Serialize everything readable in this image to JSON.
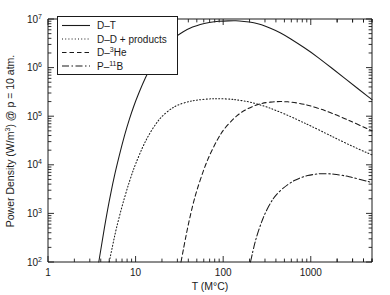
{
  "chart_data": {
    "type": "line",
    "title": "",
    "xlabel": "T (M°C)",
    "ylabel": "Power Density (W/m³) @ p = 10 atm.",
    "xscale": "log",
    "yscale": "log",
    "xlim": [
      1,
      5000
    ],
    "ylim": [
      100,
      10000000
    ],
    "grid": false,
    "legend_position": "upper-left",
    "xticks": [
      {
        "value": 1,
        "label": "1"
      },
      {
        "value": 10,
        "label": "10"
      },
      {
        "value": 100,
        "label": "100"
      },
      {
        "value": 1000,
        "label": "1000"
      }
    ],
    "yticks": [
      {
        "value": 100,
        "mantissa": "10",
        "exponent": "2"
      },
      {
        "value": 1000,
        "mantissa": "10",
        "exponent": "3"
      },
      {
        "value": 10000,
        "mantissa": "10",
        "exponent": "4"
      },
      {
        "value": 100000,
        "mantissa": "10",
        "exponent": "5"
      },
      {
        "value": 1000000,
        "mantissa": "10",
        "exponent": "6"
      },
      {
        "value": 10000000,
        "mantissa": "10",
        "exponent": "7"
      }
    ],
    "series": [
      {
        "name": "D–T",
        "legend_label_html": "D–T",
        "style": "solid",
        "color": "#1a1a1a",
        "points": [
          [
            3.8,
            100
          ],
          [
            4.2,
            300
          ],
          [
            4.6,
            800
          ],
          [
            5.0,
            1800
          ],
          [
            5.5,
            4200
          ],
          [
            6.0,
            8500
          ],
          [
            7.0,
            26000
          ],
          [
            8.0,
            62000
          ],
          [
            9.0,
            120000
          ],
          [
            10,
            205000
          ],
          [
            12,
            460000
          ],
          [
            14,
            830000
          ],
          [
            17,
            1500000
          ],
          [
            20,
            2300000
          ],
          [
            25,
            3500000
          ],
          [
            30,
            4600000
          ],
          [
            40,
            6300000
          ],
          [
            50,
            7400000
          ],
          [
            60,
            8100000
          ],
          [
            80,
            8800000
          ],
          [
            100,
            9100000
          ],
          [
            130,
            9200000
          ],
          [
            150,
            9150000
          ],
          [
            200,
            8700000
          ],
          [
            250,
            8000000
          ],
          [
            300,
            7200000
          ],
          [
            400,
            5800000
          ],
          [
            500,
            4700000
          ],
          [
            700,
            3200000
          ],
          [
            1000,
            2100000
          ],
          [
            1500,
            1200000
          ],
          [
            2000,
            800000
          ],
          [
            3000,
            450000
          ],
          [
            4000,
            300000
          ],
          [
            5000,
            220000
          ]
        ]
      },
      {
        "name": "D–D + products",
        "legend_label_html": "D–D + products",
        "style": "dotted",
        "color": "#1a1a1a",
        "points": [
          [
            5.0,
            100
          ],
          [
            5.5,
            230
          ],
          [
            6.0,
            480
          ],
          [
            7.0,
            1400
          ],
          [
            8.0,
            3200
          ],
          [
            9.0,
            6200
          ],
          [
            10,
            10500
          ],
          [
            12,
            23000
          ],
          [
            14,
            40000
          ],
          [
            17,
            70000
          ],
          [
            20,
            100000
          ],
          [
            25,
            140000
          ],
          [
            30,
            170000
          ],
          [
            40,
            200000
          ],
          [
            50,
            215000
          ],
          [
            70,
            228000
          ],
          [
            90,
            230000
          ],
          [
            120,
            225000
          ],
          [
            150,
            215000
          ],
          [
            200,
            197000
          ],
          [
            300,
            160000
          ],
          [
            400,
            132000
          ],
          [
            600,
            97000
          ],
          [
            800,
            76000
          ],
          [
            1000,
            63000
          ],
          [
            1500,
            44000
          ],
          [
            2000,
            34000
          ],
          [
            3000,
            24000
          ],
          [
            4000,
            19000
          ],
          [
            5000,
            16000
          ]
        ]
      },
      {
        "name": "D–³He",
        "legend_label_html": "D–<sup>3</sup>He",
        "style": "dashed",
        "color": "#1a1a1a",
        "points": [
          [
            33,
            100
          ],
          [
            36,
            230
          ],
          [
            40,
            600
          ],
          [
            45,
            1500
          ],
          [
            50,
            3000
          ],
          [
            60,
            8000
          ],
          [
            70,
            16000
          ],
          [
            85,
            32000
          ],
          [
            100,
            52000
          ],
          [
            130,
            88000
          ],
          [
            160,
            120000
          ],
          [
            200,
            150000
          ],
          [
            250,
            175000
          ],
          [
            300,
            190000
          ],
          [
            400,
            200000
          ],
          [
            500,
            200000
          ],
          [
            600,
            195000
          ],
          [
            800,
            180000
          ],
          [
            1000,
            163000
          ],
          [
            1300,
            140000
          ],
          [
            1600,
            122000
          ],
          [
            2000,
            104000
          ],
          [
            2500,
            88000
          ],
          [
            3000,
            76000
          ],
          [
            4000,
            60000
          ],
          [
            5000,
            50000
          ]
        ]
      },
      {
        "name": "P–¹¹B",
        "legend_label_html": "P–<sup>11</sup>B",
        "style": "dashdot",
        "color": "#1a1a1a",
        "points": [
          [
            205,
            100
          ],
          [
            220,
            180
          ],
          [
            240,
            330
          ],
          [
            270,
            620
          ],
          [
            300,
            1000
          ],
          [
            350,
            1700
          ],
          [
            400,
            2400
          ],
          [
            500,
            3500
          ],
          [
            600,
            4400
          ],
          [
            700,
            5100
          ],
          [
            850,
            5800
          ],
          [
            1000,
            6200
          ],
          [
            1200,
            6500
          ],
          [
            1400,
            6600
          ],
          [
            1700,
            6500
          ],
          [
            2000,
            6300
          ],
          [
            2500,
            5900
          ],
          [
            3000,
            5500
          ],
          [
            4000,
            4800
          ],
          [
            5000,
            4300
          ]
        ]
      }
    ]
  },
  "axes": {
    "x_label": "T (M°C)",
    "y_label_main": "Power Density (W/m",
    "y_label_sup": "3",
    "y_label_tail": ") @ p = 10 atm."
  },
  "legend": {
    "entries": [
      {
        "label": "D–T",
        "style": "solid"
      },
      {
        "label": "D–D + products",
        "style": "dotted"
      },
      {
        "label": "D–He",
        "style": "dashed",
        "sup": "3",
        "prefix": "D–",
        "suffix": "He"
      },
      {
        "label": "P–B",
        "style": "dashdot",
        "sup": "11",
        "prefix": "P–",
        "suffix": "B"
      }
    ]
  }
}
